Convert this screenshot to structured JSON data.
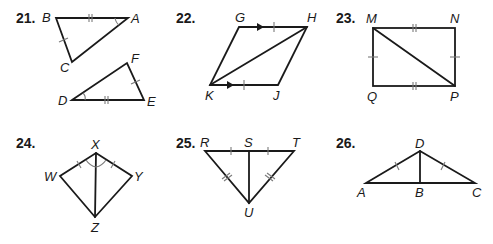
{
  "problems": [
    {
      "number": "21.",
      "labels": {
        "B": "B",
        "A": "A",
        "C": "C",
        "D": "D",
        "F": "F",
        "E": "E"
      }
    },
    {
      "number": "22.",
      "labels": {
        "G": "G",
        "H": "H",
        "K": "K",
        "J": "J"
      }
    },
    {
      "number": "23.",
      "labels": {
        "M": "M",
        "N": "N",
        "Q": "Q",
        "P": "P"
      }
    },
    {
      "number": "24.",
      "labels": {
        "X": "X",
        "W": "W",
        "Y": "Y",
        "Z": "Z"
      }
    },
    {
      "number": "25.",
      "labels": {
        "R": "R",
        "S": "S",
        "T": "T",
        "U": "U"
      }
    },
    {
      "number": "26.",
      "labels": {
        "D": "D",
        "A": "A",
        "B": "B",
        "C": "C"
      }
    }
  ],
  "figures": [
    {
      "id": 21,
      "shape": "two triangles",
      "markings": [
        "BA ≅ DE (double tick)",
        "BC ≅ FE (single tick)",
        "∠A ≅ ∠D (arc)"
      ]
    },
    {
      "id": 22,
      "shape": "parallelogram with diagonal KH",
      "markings": [
        "GH ∥ KJ (arrows)",
        "GH ≅ KJ (single tick)"
      ]
    },
    {
      "id": 23,
      "shape": "rectangle with diagonal MP",
      "markings": [
        "MN ≅ QP (double tick)",
        "MQ ≅ NP (single tick)"
      ]
    },
    {
      "id": 24,
      "shape": "kite with diagonal XZ",
      "markings": [
        "XW ≅ XY (single tick)",
        "∠WXZ ≅ ∠YXZ (arcs)"
      ]
    },
    {
      "id": 25,
      "shape": "triangle with segment SU",
      "markings": [
        "RS ≅ ST (single tick)",
        "RU ≅ TU (double tick)"
      ]
    },
    {
      "id": 26,
      "shape": "triangle with segment DB",
      "markings": [
        "AD ≅ CD (single tick)"
      ]
    }
  ]
}
